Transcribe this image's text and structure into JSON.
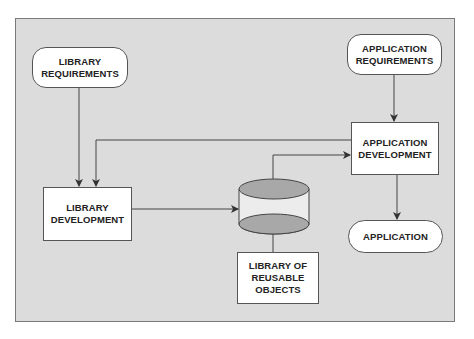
{
  "diagram": {
    "nodes": {
      "library_requirements": {
        "label": "LIBRARY\nREQUIREMENTS",
        "shape": "rounded"
      },
      "application_requirements": {
        "label": "APPLICATION\nREQUIREMENTS",
        "shape": "rounded"
      },
      "application_development": {
        "label": "APPLICATION\nDEVELOPMENT",
        "shape": "rectangle"
      },
      "library_development": {
        "label": "LIBRARY\nDEVELOPMENT",
        "shape": "rectangle"
      },
      "library_store": {
        "label": "",
        "shape": "cylinder"
      },
      "library_of_reusable_objects": {
        "label": "LIBRARY OF\nREUSABLE\nOBJECTS",
        "shape": "rectangle"
      },
      "application": {
        "label": "APPLICATION",
        "shape": "rounded"
      }
    },
    "edges": [
      {
        "from": "library_requirements",
        "to": "library_development"
      },
      {
        "from": "application_development",
        "to": "library_development"
      },
      {
        "from": "application_requirements",
        "to": "application_development"
      },
      {
        "from": "library_development",
        "to": "library_store"
      },
      {
        "from": "library_store",
        "to": "application_development"
      },
      {
        "from": "application_development",
        "to": "application"
      },
      {
        "from": "library_store",
        "to": "library_of_reusable_objects",
        "arrow": false
      }
    ],
    "colors": {
      "background": "#dcdcdc",
      "node_fill": "#ffffff",
      "cylinder_fill": "#a8a8a8",
      "line": "#444444"
    }
  }
}
